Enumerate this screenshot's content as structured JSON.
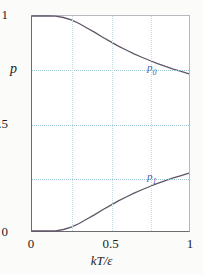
{
  "chart_data": {
    "type": "line",
    "title": "",
    "subtitle": "",
    "xlabel": "kT/ε",
    "ylabel": "p",
    "xlim": [
      0,
      1
    ],
    "ylim": [
      0,
      1
    ],
    "xticks": [
      "0",
      "0.5",
      "1"
    ],
    "xtick_values": [
      0,
      0.5,
      1
    ],
    "yticks": [
      "0",
      "0.5",
      "1"
    ],
    "ytick_values": [
      0,
      0.5,
      1
    ],
    "grid": true,
    "grid_color": "#9fc6d4",
    "grid_x_values": [
      0.25,
      0.5,
      0.75
    ],
    "grid_y_values": [
      0.25,
      0.5,
      0.75
    ],
    "legend": "inline-annotations",
    "curve_color": "#5f5566",
    "annotation_color": "#3f5fa8",
    "series": [
      {
        "name": "p0",
        "label": "p",
        "label_sub": "0",
        "label_x": 0.76,
        "label_y": 0.75,
        "x": [
          0.0,
          0.05,
          0.1,
          0.15,
          0.2,
          0.25,
          0.3,
          0.35,
          0.4,
          0.45,
          0.5,
          0.55,
          0.6,
          0.65,
          0.7,
          0.75,
          0.8,
          0.85,
          0.9,
          0.95,
          1.0
        ],
        "values": [
          1.0,
          1.0,
          1.0,
          0.999,
          0.993,
          0.982,
          0.965,
          0.944,
          0.924,
          0.901,
          0.881,
          0.86,
          0.842,
          0.824,
          0.808,
          0.793,
          0.779,
          0.766,
          0.753,
          0.742,
          0.731
        ]
      },
      {
        "name": "p1",
        "label": "p",
        "label_sub": "1",
        "label_x": 0.76,
        "label_y": 0.25,
        "x": [
          0.0,
          0.05,
          0.1,
          0.15,
          0.2,
          0.25,
          0.3,
          0.35,
          0.4,
          0.45,
          0.5,
          0.55,
          0.6,
          0.65,
          0.7,
          0.75,
          0.8,
          0.85,
          0.9,
          0.95,
          1.0
        ],
        "values": [
          0.0,
          0.0,
          0.0,
          0.001,
          0.007,
          0.018,
          0.035,
          0.056,
          0.076,
          0.099,
          0.119,
          0.14,
          0.158,
          0.176,
          0.192,
          0.207,
          0.221,
          0.234,
          0.247,
          0.258,
          0.269
        ]
      }
    ]
  }
}
